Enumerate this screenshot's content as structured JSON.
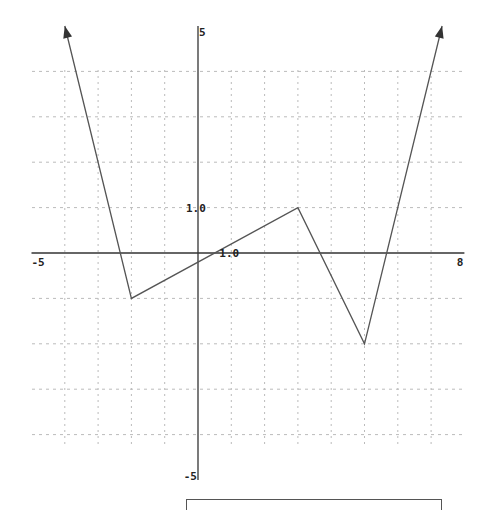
{
  "chart_data": {
    "type": "line",
    "title": "",
    "xlabel": "",
    "ylabel": "",
    "xlim": [
      -5,
      8
    ],
    "ylim": [
      -5,
      5
    ],
    "grid": true,
    "grid_style": "dotted",
    "x_tick_step": 1,
    "y_tick_step": 1,
    "axis_labels": {
      "x_min": "-5",
      "x_max": "8",
      "y_max": "5",
      "y_min": "-5",
      "x_unit": "1.0",
      "y_unit": "1.0"
    },
    "series": [
      {
        "name": "piecewise linear function",
        "x": [
          -4,
          -2,
          3,
          5,
          7.33
        ],
        "y": [
          5,
          -1,
          1,
          -2,
          5
        ],
        "arrows": {
          "start": true,
          "end": true
        },
        "color": "#555555"
      }
    ],
    "legend": null
  },
  "colors": {
    "axis": "#333333",
    "grid": "#bbbbbb",
    "line": "#555555",
    "background": "#ffffff"
  },
  "answer_box": {
    "value": ""
  }
}
